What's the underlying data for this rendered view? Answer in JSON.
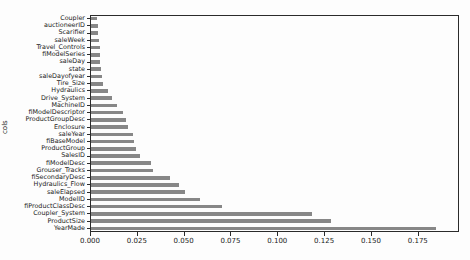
{
  "chart_data": {
    "type": "bar",
    "orientation": "horizontal",
    "title": "",
    "xlabel": "",
    "ylabel": "cols",
    "legend": null,
    "grid": false,
    "bar_color": "#878787",
    "background_color": "#fdfdfd",
    "xlim": [
      0,
      0.197
    ],
    "xticks": [
      0.0,
      0.025,
      0.05,
      0.075,
      0.1,
      0.125,
      0.15,
      0.175
    ],
    "xtick_labels": [
      "0.000",
      "0.025",
      "0.050",
      "0.075",
      "0.100",
      "0.125",
      "0.150",
      "0.175"
    ],
    "categories_top_to_bottom": [
      "Coupler",
      "auctioneerID",
      "Scarifier",
      "saleWeek",
      "Travel_Controls",
      "fiModelSeries",
      "saleDay",
      "state",
      "saleDayofyear",
      "Tire_Size",
      "Hydraulics",
      "Drive_System",
      "MachineID",
      "fiModelDescriptor",
      "ProductGroupDesc",
      "Enclosure",
      "saleYear",
      "fiBaseModel",
      "ProductGroup",
      "SalesID",
      "fiModelDesc",
      "Grouser_Tracks",
      "fiSecondaryDesc",
      "Hydraulics_Flow",
      "saleElapsed",
      "ModelID",
      "fiProductClassDesc",
      "Coupler_System",
      "ProductSize",
      "YearMade"
    ],
    "values": [
      0.003,
      0.0035,
      0.004,
      0.0045,
      0.005,
      0.005,
      0.005,
      0.0055,
      0.006,
      0.0065,
      0.009,
      0.011,
      0.014,
      0.017,
      0.0185,
      0.02,
      0.0225,
      0.023,
      0.024,
      0.026,
      0.032,
      0.033,
      0.042,
      0.047,
      0.05,
      0.058,
      0.07,
      0.118,
      0.128,
      0.184
    ]
  }
}
